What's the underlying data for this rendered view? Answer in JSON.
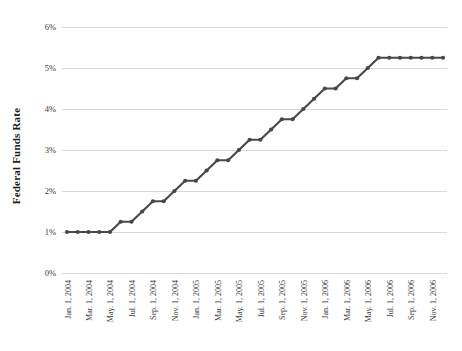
{
  "chart_data": {
    "type": "line",
    "title": "",
    "xlabel": "",
    "ylabel": "Federal Funds Rate",
    "ylim": [
      0,
      6
    ],
    "ytick_labels": [
      "0%",
      "1%",
      "2%",
      "3%",
      "4%",
      "5%",
      "6%"
    ],
    "ytick_values": [
      0,
      1,
      2,
      3,
      4,
      5,
      6
    ],
    "xtick_labels": [
      "Jan. 1, 2004",
      "Mar. 1, 2004",
      "May. 1, 2004",
      "Jul. 1, 2004",
      "Sep. 1, 2004",
      "Nov. 1, 2004",
      "Jan. 1, 2005",
      "Mar. 1, 2005",
      "May. 1, 2005",
      "Jul. 1, 2005",
      "Sep. 1, 2005",
      "Nov. 1, 2005",
      "Jan. 1, 2006",
      "Mar. 1, 2006",
      "May. 1, 2006",
      "Jul. 1, 2006",
      "Sep. 1, 2006",
      "Nov. 1, 2006"
    ],
    "xticks_every_n_points": 2,
    "series": [
      {
        "name": "Federal Funds Rate",
        "values": [
          1.0,
          1.0,
          1.0,
          1.0,
          1.0,
          1.25,
          1.25,
          1.5,
          1.75,
          1.75,
          2.0,
          2.25,
          2.25,
          2.5,
          2.75,
          2.75,
          3.0,
          3.25,
          3.25,
          3.5,
          3.75,
          3.75,
          4.0,
          4.25,
          4.5,
          4.5,
          4.75,
          4.75,
          5.0,
          5.25,
          5.25,
          5.25,
          5.25,
          5.25,
          5.25,
          5.25
        ]
      }
    ],
    "grid": "horizontal",
    "legend": "none",
    "marker": "circle",
    "colors": {
      "line": "#4a4a4a",
      "marker": "#474747",
      "gridline": "#d9d9d9",
      "background": "#ffffff"
    }
  }
}
